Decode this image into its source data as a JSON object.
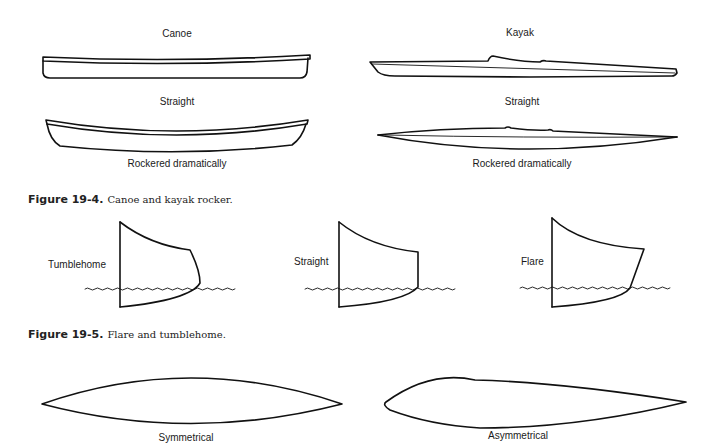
{
  "figure_19_4": {
    "caption_number": "Figure 19-4.",
    "caption_text": "Canoe and kayak rocker.",
    "canoe": {
      "title": "Canoe",
      "straight_label": "Straight",
      "rockered_label": "Rockered dramatically"
    },
    "kayak": {
      "title": "Kayak",
      "straight_label": "Straight",
      "rockered_label": "Rockered dramatically"
    }
  },
  "figure_19_5": {
    "caption_number": "Figure 19-5.",
    "caption_text": "Flare and tumblehome.",
    "sections": [
      {
        "label": "Tumblehome"
      },
      {
        "label": "Straight"
      },
      {
        "label": "Flare"
      }
    ]
  },
  "hull_plans": {
    "symmetrical_label": "Symmetrical",
    "asymmetrical_label": "Asymmetrical"
  }
}
